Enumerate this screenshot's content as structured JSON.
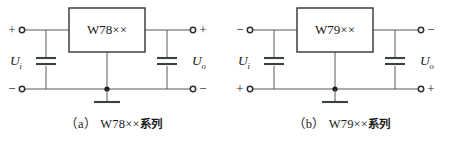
{
  "figure": {
    "width": 455,
    "height": 143,
    "background": "#ffffff",
    "line_color": "#555b5e",
    "ink_color": "#1a1a1a"
  },
  "circuits": [
    {
      "id": "a",
      "caption_index": "（a）",
      "caption_label": "W78××",
      "caption_suffix": "系列",
      "regulator_label": "W78××",
      "input_label_base": "U",
      "input_label_sub": "i",
      "output_label_base": "U",
      "output_label_sub": "o",
      "terminal_top_left_sign": "+",
      "terminal_bottom_left_sign": "−",
      "terminal_top_right_sign": "+",
      "terminal_bottom_right_sign": "−",
      "ground_symbol": "ground-bar",
      "components": [
        {
          "name": "input-capacitor",
          "type": "capacitor"
        },
        {
          "name": "output-capacitor",
          "type": "capacitor"
        },
        {
          "name": "regulator-ic",
          "type": "ic-block"
        }
      ]
    },
    {
      "id": "b",
      "caption_index": "（b）",
      "caption_label": "W79××",
      "caption_suffix": "系列",
      "regulator_label": "W79××",
      "input_label_base": "U",
      "input_label_sub": "i",
      "output_label_base": "U",
      "output_label_sub": "o",
      "terminal_top_left_sign": "−",
      "terminal_bottom_left_sign": "+",
      "terminal_top_right_sign": "−",
      "terminal_bottom_right_sign": "+",
      "ground_symbol": "ground-bar",
      "components": [
        {
          "name": "input-capacitor",
          "type": "capacitor"
        },
        {
          "name": "output-capacitor",
          "type": "capacitor"
        },
        {
          "name": "regulator-ic",
          "type": "ic-block"
        }
      ]
    }
  ]
}
